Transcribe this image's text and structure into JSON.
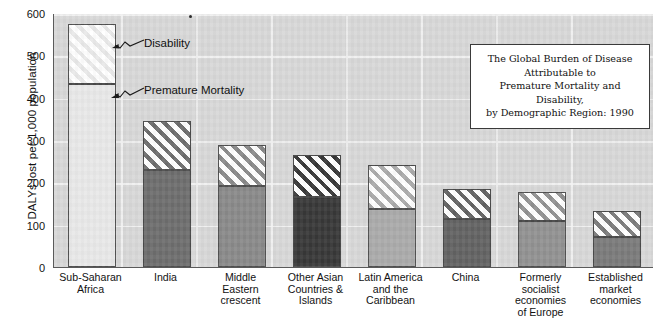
{
  "chart_data": {
    "type": "bar",
    "subtype": "stacked-bar",
    "title": "The Global Burden of Disease Attributable to Premature Mortality and Disability, by Demographic Region: 1990",
    "title_lines": [
      "The Global Burden of Disease Attributable to",
      "Premature Mortality and Disability,",
      "by Demographic Region: 1990"
    ],
    "xlabel": "",
    "ylabel": "DALYs lost per 1,000 population",
    "ylim": [
      0,
      600
    ],
    "yticks": [
      0,
      100,
      200,
      300,
      400,
      500,
      600
    ],
    "ytick_labels": [
      "0",
      "100",
      "200",
      "300",
      "400",
      "500",
      "600"
    ],
    "grid": true,
    "legend": "callout-annotations",
    "annotations": [
      {
        "label": "Disability",
        "points_to": "disability-segment-sub-saharan-africa"
      },
      {
        "label": "Premature Mortality",
        "points_to": "mortality-segment-sub-saharan-africa"
      }
    ],
    "categories": [
      "Sub-Saharan Africa",
      "India",
      "Middle Eastern crescent",
      "Other Asian Countries & Islands",
      "Latin America and the Caribbean",
      "China",
      "Formerly socialist economies of Europe",
      "Established market economies"
    ],
    "category_label_lines": [
      [
        "Sub-Saharan",
        "Africa"
      ],
      [
        "India"
      ],
      [
        "Middle",
        "Eastern",
        "crescent"
      ],
      [
        "Other Asian",
        "Countries &",
        "Islands"
      ],
      [
        "Latin America",
        "and the",
        "Caribbean"
      ],
      [
        "China"
      ],
      [
        "Formerly",
        "socialist",
        "economies",
        "of Europe"
      ],
      [
        "Established",
        "market",
        "economies"
      ]
    ],
    "series": [
      {
        "name": "Premature Mortality",
        "values": [
          433,
          228,
          192,
          165,
          138,
          113,
          108,
          72
        ]
      },
      {
        "name": "Disability",
        "values": [
          142,
          117,
          96,
          100,
          102,
          72,
          70,
          61
        ]
      }
    ],
    "totals": [
      575,
      345,
      288,
      265,
      240,
      185,
      178,
      133
    ],
    "bar_colors": [
      "#e9e9e9",
      "#6e6e6e",
      "#8a8a8a",
      "#383838",
      "#ababab",
      "#636363",
      "#929292",
      "#7b7b7b"
    ],
    "plot_background": "#d8d8d8",
    "gridline_color": "#f2f2f2",
    "axis_color": "#5a5a5a",
    "bar_border_color": "#4a4a4a",
    "hatch_background": "#ffffff"
  }
}
